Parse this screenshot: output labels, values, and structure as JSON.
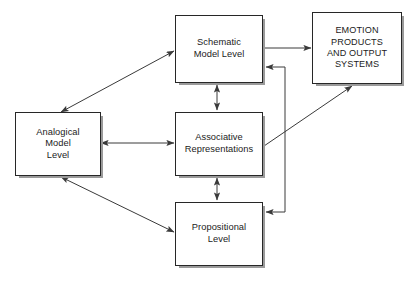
{
  "diagram": {
    "canvas": {
      "width": 410,
      "height": 284,
      "background": "#ffffff"
    },
    "style": {
      "box_fill": "#ffffff",
      "box_border": "#272727",
      "box_shadow": "#9a9a9a",
      "arrow_color": "#3a3a3a",
      "text_color": "#1b1b1b"
    },
    "nodes": [
      {
        "id": "schematic",
        "label": "Schematic\nModel Level",
        "lines": [
          "Schematic",
          "Model Level"
        ],
        "x": 175,
        "y": 15,
        "width": 88,
        "height": 68,
        "uppercase": false
      },
      {
        "id": "emotion",
        "label": "EMOTION\nPRODUCTS\nAND OUTPUT\nSYSTEMS",
        "lines": [
          "EMOTION",
          "PRODUCTS",
          "AND OUTPUT",
          "SYSTEMS"
        ],
        "x": 312,
        "y": 12,
        "width": 90,
        "height": 72,
        "uppercase": true
      },
      {
        "id": "analogical",
        "label": "Analogical\nModel\nLevel",
        "lines": [
          "Analogical",
          "Model",
          "Level"
        ],
        "x": 15,
        "y": 112,
        "width": 86,
        "height": 64,
        "uppercase": false
      },
      {
        "id": "associative",
        "label": "Associative\nRepresentations",
        "lines": [
          "Associative",
          "Representations"
        ],
        "x": 175,
        "y": 112,
        "width": 88,
        "height": 64,
        "uppercase": false
      },
      {
        "id": "propositional",
        "label": "Propositional\nLevel",
        "lines": [
          "Propositional",
          "Level"
        ],
        "x": 175,
        "y": 202,
        "width": 88,
        "height": 64,
        "uppercase": false
      }
    ],
    "edges": [
      {
        "id": "analogical-schematic",
        "from": "analogical",
        "to": "schematic",
        "kind": "diagonal",
        "heads": "both",
        "points": [
          [
            61,
            112
          ],
          [
            174,
            51
          ]
        ]
      },
      {
        "id": "analogical-associative",
        "from": "analogical",
        "to": "associative",
        "kind": "straight",
        "heads": "both",
        "points": [
          [
            101,
            143
          ],
          [
            174,
            143
          ]
        ]
      },
      {
        "id": "analogical-propositional",
        "from": "analogical",
        "to": "propositional",
        "kind": "diagonal",
        "heads": "both",
        "points": [
          [
            61,
            177
          ],
          [
            174,
            232
          ]
        ]
      },
      {
        "id": "schematic-associative",
        "from": "schematic",
        "to": "associative",
        "kind": "straight",
        "heads": "both",
        "points": [
          [
            217,
            84
          ],
          [
            217,
            111
          ]
        ]
      },
      {
        "id": "associative-propositional",
        "from": "associative",
        "to": "propositional",
        "kind": "straight",
        "heads": "both",
        "points": [
          [
            217,
            177
          ],
          [
            217,
            201
          ]
        ]
      },
      {
        "id": "schematic-emotion",
        "from": "schematic",
        "to": "emotion",
        "kind": "straight",
        "heads": "end",
        "points": [
          [
            264,
            48
          ],
          [
            311,
            48
          ]
        ]
      },
      {
        "id": "associative-emotion",
        "from": "associative",
        "to": "emotion",
        "kind": "diagonal",
        "heads": "end",
        "points": [
          [
            264,
            146
          ],
          [
            352,
            86
          ]
        ]
      },
      {
        "id": "feedback-to-schematic-and-propositional",
        "from": "emotion",
        "to": "schematic",
        "kind": "elbow",
        "heads": "end",
        "points": [
          [
            285,
            212
          ],
          [
            285,
            67
          ],
          [
            265,
            67
          ]
        ]
      },
      {
        "id": "feedback-branch-propositional",
        "from": "emotion",
        "to": "propositional",
        "kind": "elbow",
        "heads": "end",
        "points": [
          [
            285,
            212
          ],
          [
            265,
            212
          ]
        ]
      }
    ]
  }
}
